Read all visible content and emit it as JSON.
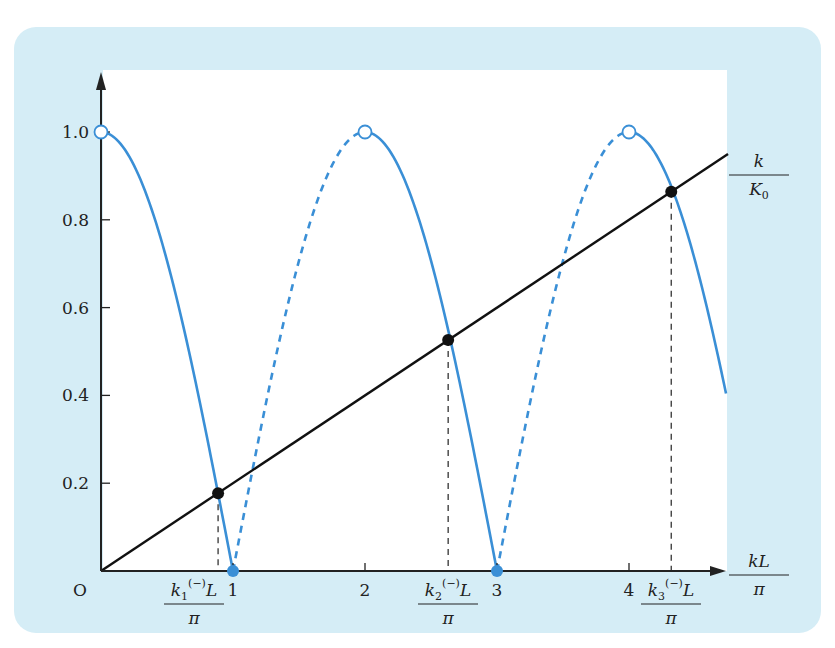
{
  "chart_data": {
    "type": "line",
    "title": "",
    "xlabel": {
      "numerator": "kL",
      "denominator": "π"
    },
    "ylabel": "",
    "xlim": [
      0,
      4.75
    ],
    "ylim": [
      0,
      1.1
    ],
    "x_ticks": [
      1,
      2,
      3,
      4
    ],
    "x_tick_labels": [
      "1",
      "2",
      "3",
      "4"
    ],
    "y_ticks": [
      0.2,
      0.4,
      0.6,
      0.8,
      1.0
    ],
    "y_tick_labels": [
      "0.2",
      "0.4",
      "0.6",
      "0.8",
      "1.0"
    ],
    "origin_label": "O",
    "grid": false,
    "series": [
      {
        "name": "|cos(kL/2·π)| curve",
        "function": "abs(cos(pi*x/2))",
        "x_range": [
          0,
          4.735
        ],
        "color": "#3a8fd6",
        "solid_segments": [
          [
            0,
            1
          ],
          [
            2,
            3
          ],
          [
            4,
            4.735
          ]
        ],
        "dashed_segments": [
          [
            1,
            2
          ],
          [
            3,
            4
          ]
        ]
      },
      {
        "name": "k/K0 line",
        "label": {
          "numerator": "k",
          "denominator": "K",
          "denominator_sub": "0"
        },
        "slope": 0.2,
        "x_range": [
          0,
          4.75
        ],
        "color": "#111111"
      }
    ],
    "open_points": [
      {
        "x": 0,
        "y": 1.0
      },
      {
        "x": 2,
        "y": 1.0
      },
      {
        "x": 4,
        "y": 1.0
      }
    ],
    "blue_points": [
      {
        "x": 1,
        "y": 0
      },
      {
        "x": 3,
        "y": 0
      }
    ],
    "intersections": [
      {
        "x": 0.887,
        "y": 0.177,
        "label": {
          "k_sub": "1",
          "sup": "(−)",
          "rest": "L",
          "denominator": "π"
        }
      },
      {
        "x": 2.63,
        "y": 0.526,
        "label": {
          "k_sub": "2",
          "sup": "(−)",
          "rest": "L",
          "denominator": "π"
        }
      },
      {
        "x": 4.32,
        "y": 0.864,
        "label": {
          "k_sub": "3",
          "sup": "(−)",
          "rest": "L",
          "denominator": "π"
        }
      }
    ],
    "colors": {
      "panel": "#d5edf6",
      "curve": "#3a8fd6",
      "line": "#111111",
      "plot_bg": "#ffffff"
    }
  }
}
